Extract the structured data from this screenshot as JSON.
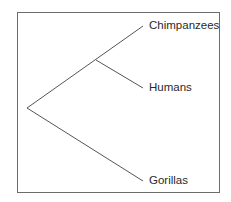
{
  "diagram": {
    "type": "phylogenetic-tree",
    "colors": {
      "line": "#555555",
      "border": "#6b6b6b",
      "text": "#2a2a2a",
      "background": "#ffffff"
    },
    "root": {
      "x": 27,
      "y": 108
    },
    "internal_node": {
      "x": 96,
      "y": 60
    },
    "leaves": [
      {
        "label": "Chimpanzees",
        "tip": {
          "x": 143,
          "y": 26
        },
        "label_pos": {
          "x": 149,
          "y": 20
        }
      },
      {
        "label": "Humans",
        "tip": {
          "x": 143,
          "y": 88
        },
        "label_pos": {
          "x": 149,
          "y": 82
        }
      },
      {
        "label": "Gorillas",
        "tip": {
          "x": 143,
          "y": 181
        },
        "label_pos": {
          "x": 149,
          "y": 175
        }
      }
    ],
    "edges": [
      {
        "from": "root",
        "to": "Chimpanzees",
        "x1": 27,
        "y1": 108,
        "x2": 143,
        "y2": 26
      },
      {
        "from": "internal_node",
        "to": "Humans",
        "x1": 96,
        "y1": 60,
        "x2": 143,
        "y2": 88
      },
      {
        "from": "root",
        "to": "Gorillas",
        "x1": 27,
        "y1": 108,
        "x2": 143,
        "y2": 181
      }
    ]
  }
}
